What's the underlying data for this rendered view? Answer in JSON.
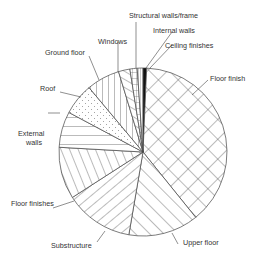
{
  "chart_data": {
    "type": "pie",
    "title": "",
    "start_angle_deg": 0,
    "direction": "clockwise",
    "center": [
      143,
      152
    ],
    "radius": 84,
    "slices": [
      {
        "label": "Ceiling finishes",
        "value": 0.7,
        "pattern": "solid-black"
      },
      {
        "label": "Floor finish",
        "value": 38.5,
        "pattern": "crosshatch"
      },
      {
        "label": "Upper floor",
        "value": 13.5,
        "pattern": "diagonal-up"
      },
      {
        "label": "Substructure",
        "value": 13.2,
        "pattern": "diagonal-down"
      },
      {
        "label": "Floor finishes",
        "value": 10.0,
        "pattern": "steep-lines"
      },
      {
        "label": "External walls",
        "value": 6.9,
        "pattern": "horizontal"
      },
      {
        "label": "Roof",
        "value": 6.1,
        "pattern": "dots"
      },
      {
        "label": "Ground floor",
        "value": 6.4,
        "pattern": "vertical"
      },
      {
        "label": "Windows",
        "value": 2.2,
        "pattern": "diagonal-steep"
      },
      {
        "label": "Structural walls/frame",
        "value": 1.4,
        "pattern": "grid"
      },
      {
        "label": "Internal walls",
        "value": 1.1,
        "pattern": "vertical-dense"
      }
    ],
    "legend": "none (callout labels)",
    "units": "% of total"
  },
  "labels": {
    "structural": "Structural walls/frame",
    "internal": "Internal walls",
    "ceiling": "Ceiling finishes",
    "floor_finish": "Floor finish",
    "windows": "Windows",
    "ground_floor": "Ground floor",
    "roof": "Roof",
    "external_1": "External",
    "external_2": "walls",
    "floor_finishes": "Floor finishes",
    "substructure": "Substructure",
    "upper_floor": "Upper floor"
  }
}
